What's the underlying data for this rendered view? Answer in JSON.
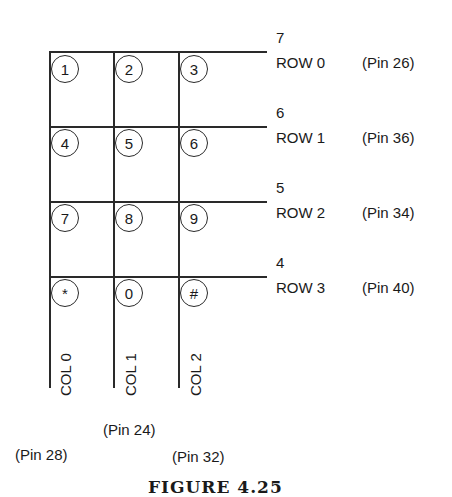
{
  "figure": {
    "caption": "FIGURE 4.25"
  },
  "keypad": {
    "keys": [
      [
        "1",
        "2",
        "3"
      ],
      [
        "4",
        "5",
        "6"
      ],
      [
        "7",
        "8",
        "9"
      ],
      [
        "*",
        "0",
        "#"
      ]
    ]
  },
  "rows": [
    {
      "number": "7",
      "label": "ROW 0",
      "pin": "(Pin 26)"
    },
    {
      "number": "6",
      "label": "ROW 1",
      "pin": "(Pin 36)"
    },
    {
      "number": "5",
      "label": "ROW 2",
      "pin": "(Pin 34)"
    },
    {
      "number": "4",
      "label": "ROW 3",
      "pin": "(Pin 40)"
    }
  ],
  "columns": [
    {
      "label": "COL 0",
      "pin": "(Pin 28)"
    },
    {
      "label": "COL 1",
      "pin": "(Pin 24)"
    },
    {
      "label": "COL 2",
      "pin": "(Pin 32)"
    }
  ]
}
